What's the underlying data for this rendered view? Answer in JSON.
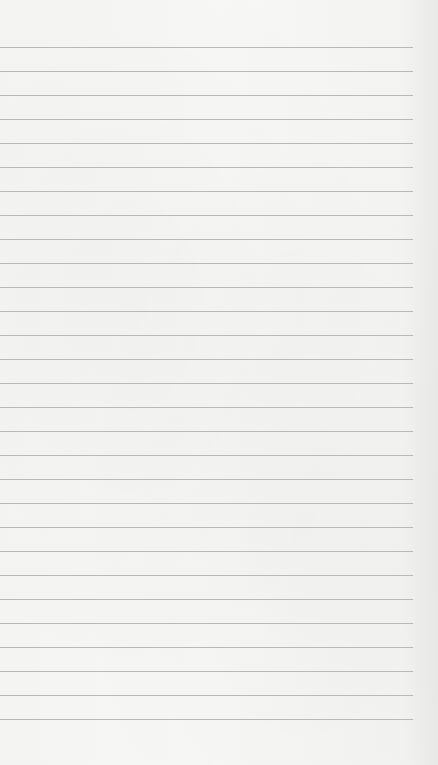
{
  "page": {
    "type": "lined-paper",
    "background_color": "#f5f5f4",
    "line_color": "#b9b9b9",
    "line_count": 29,
    "first_line_y": 47,
    "line_spacing": 24,
    "line_width": 413
  }
}
